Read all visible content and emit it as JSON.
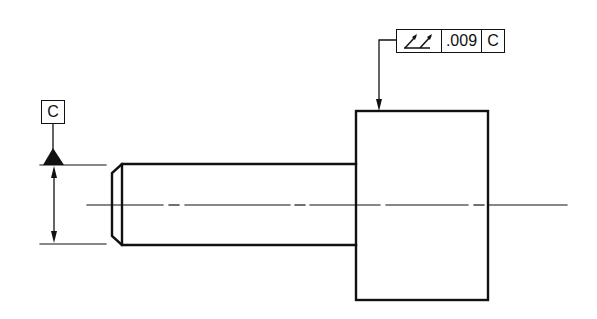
{
  "drawing": {
    "type": "GD&T total runout callout on stepped shaft",
    "feature_control_frame": {
      "symbol": "total-runout",
      "tolerance": ".009",
      "datum": "C"
    },
    "datum_feature_symbol": {
      "label": "C"
    },
    "colors": {
      "line": "#111111",
      "background": "#ffffff"
    }
  }
}
